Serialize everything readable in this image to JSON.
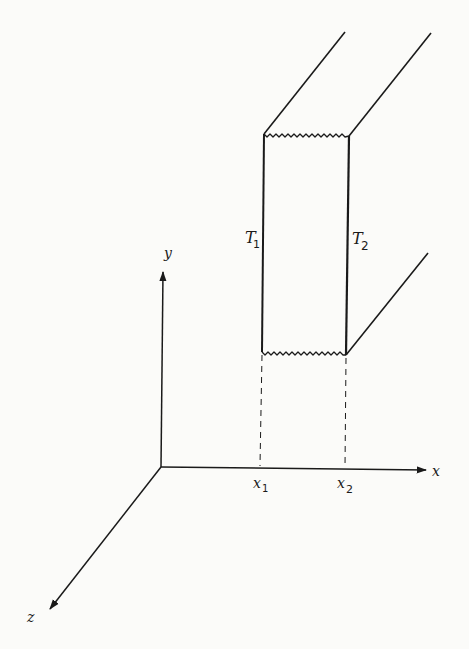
{
  "diagram": {
    "title": "",
    "colors": {
      "background": "#fbfbf9",
      "ink": "#1a1a1a"
    },
    "axes": {
      "x": {
        "label": "x"
      },
      "y": {
        "label": "y"
      },
      "z": {
        "label": "z"
      }
    },
    "ticks": [
      {
        "main": "x",
        "sub": "1"
      },
      {
        "main": "x",
        "sub": "2"
      }
    ],
    "faces": [
      {
        "main": "T",
        "sub": "1"
      },
      {
        "main": "T",
        "sub": "2"
      }
    ]
  }
}
